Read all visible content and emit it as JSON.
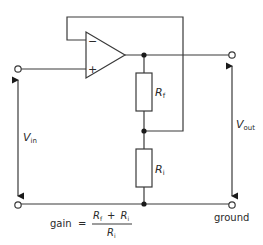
{
  "diagram": {
    "opamp": {
      "minus_sign": "−",
      "plus_sign": "+"
    },
    "resistors": {
      "rf": {
        "main": "R",
        "sub": "f"
      },
      "ri": {
        "main": "R",
        "sub": "i"
      }
    },
    "labels": {
      "vin": {
        "main": "V",
        "sub": "in"
      },
      "vout": {
        "main": "V",
        "sub": "out"
      },
      "ground": "ground"
    },
    "formula": {
      "lhs": "gain",
      "equals": "=",
      "num_a": {
        "main": "R",
        "sub": "f"
      },
      "plus": "+",
      "num_b": {
        "main": "R",
        "sub": "i"
      },
      "den": {
        "main": "R",
        "sub": "i"
      }
    },
    "colors": {
      "line": "#3a3a3a",
      "dot": "#1a1a1a",
      "text": "#2a2a2a",
      "background": "#ffffff"
    }
  }
}
